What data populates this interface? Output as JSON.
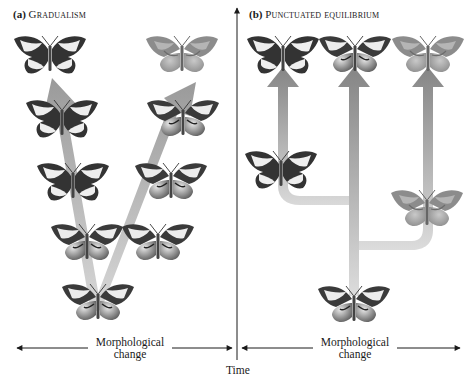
{
  "panels": {
    "a": {
      "label": "(a)",
      "title": "Gradualism"
    },
    "b": {
      "label": "(b)",
      "title": "Punctuated equilibrium"
    }
  },
  "axes": {
    "time_label": "Time",
    "morph_label_line1": "Morphological",
    "morph_label_line2": "change"
  },
  "colors": {
    "arrow_fill_dark": "#8e8e8e",
    "arrow_fill_light": "#d4d4d4",
    "butterfly_dark": "#3d3d3d",
    "butterfly_light": "#ebebeb",
    "butterfly_pale": "#9a9a9a",
    "axis": "#1a1a1a"
  },
  "butterflies": {
    "gradualism": [
      {
        "id": "a-top-left",
        "morph": "dark"
      },
      {
        "id": "a-top-right",
        "morph": "pale"
      },
      {
        "id": "a-r2-left",
        "morph": "dark"
      },
      {
        "id": "a-r2-right",
        "morph": "mixed"
      },
      {
        "id": "a-r3-left",
        "morph": "dark"
      },
      {
        "id": "a-r3-right",
        "morph": "mixed"
      },
      {
        "id": "a-r4-left",
        "morph": "mixed"
      },
      {
        "id": "a-r4-right",
        "morph": "mixed"
      },
      {
        "id": "a-ancestor",
        "morph": "mixed"
      }
    ],
    "punctuated": [
      {
        "id": "b-top-left",
        "morph": "dark"
      },
      {
        "id": "b-top-mid",
        "morph": "mixed"
      },
      {
        "id": "b-top-right",
        "morph": "pale"
      },
      {
        "id": "b-mid-left",
        "morph": "dark"
      },
      {
        "id": "b-mid-right",
        "morph": "pale"
      },
      {
        "id": "b-ancestor",
        "morph": "mixed"
      }
    ]
  }
}
